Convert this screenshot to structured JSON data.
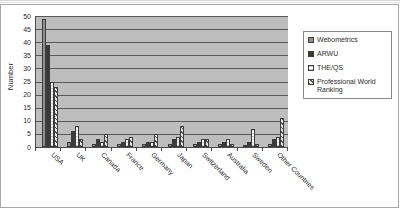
{
  "chart_data": {
    "type": "bar",
    "title": "",
    "xlabel": "",
    "ylabel": "Number",
    "ylim": [
      0,
      50
    ],
    "ytick_step": 5,
    "yticks": [
      "0",
      "5",
      "10",
      "15",
      "20",
      "25",
      "30",
      "35",
      "40",
      "45",
      "50"
    ],
    "grid": true,
    "legend_position": "right",
    "categories": [
      "USA",
      "UK",
      "Canada",
      "France",
      "Germany",
      "Japan",
      "Switzerland",
      "Australia",
      "Sweden",
      "Other Countries"
    ],
    "series": [
      {
        "name": "Webometrics",
        "fill": "light-grey-solid",
        "values": [
          49,
          2,
          1,
          1,
          1,
          1,
          1,
          1,
          0,
          1
        ]
      },
      {
        "name": "ARWU",
        "fill": "dark-grey-solid",
        "values": [
          39,
          6,
          3,
          2,
          2,
          3,
          2,
          2,
          2,
          3
        ]
      },
      {
        "name": "THE/QS",
        "fill": "white-fine-stripe",
        "values": [
          25,
          8,
          2,
          3,
          2,
          4,
          3,
          3,
          7,
          4
        ]
      },
      {
        "name": "Professional World Ranking",
        "fill": "diagonal-hatch",
        "values": [
          23,
          3,
          5,
          4,
          5,
          8,
          3,
          1,
          1,
          11
        ]
      }
    ]
  },
  "legend": {
    "items": [
      {
        "label": "Webometrics"
      },
      {
        "label": "ARWU"
      },
      {
        "label": "THE/QS"
      },
      {
        "label": "Professional World Ranking"
      }
    ]
  }
}
